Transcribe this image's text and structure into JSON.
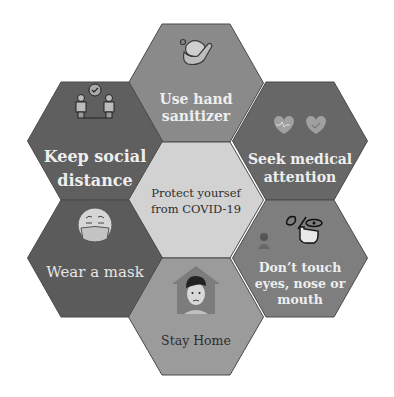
{
  "diagram": {
    "title": "Protect yoursef from COVID-19",
    "center": {
      "line1": "Protect yoursef",
      "line2": "from COVID-19",
      "color": "#d2d2d2"
    },
    "hexes": [
      {
        "id": "top",
        "line1": "Use hand",
        "line2": "sanitizer",
        "icon": "hands-washing-icon",
        "color": "#8a8a8a"
      },
      {
        "id": "upper-left",
        "line1": "Keep social",
        "line2": "distance",
        "icon": "social-distance-icon",
        "color": "#5f5f5f"
      },
      {
        "id": "upper-right",
        "line1": "Seek medical",
        "line2": "attention",
        "icon": "hearts-icon",
        "color": "#676767"
      },
      {
        "id": "lower-left",
        "line1": "Wear a mask",
        "icon": "masked-face-icon",
        "color": "#5b5b5b"
      },
      {
        "id": "lower-right",
        "line1": "Don’t touch",
        "line2": "eyes, nose or",
        "line3": "mouth",
        "icon": "no-touch-face-icon",
        "color": "#7e7e7e"
      },
      {
        "id": "bottom",
        "line1": "Stay Home",
        "icon": "stay-home-icon",
        "color": "#9b9b9b"
      }
    ]
  }
}
